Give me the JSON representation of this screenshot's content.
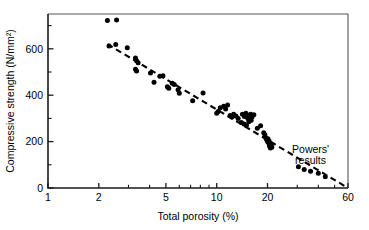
{
  "chart_data": {
    "type": "scatter",
    "title": "",
    "xlabel": "Total porosity (%)",
    "ylabel": "Compressive strength (N/mm²)",
    "xscale": "log",
    "yscale": "linear",
    "xlim": [
      1,
      60
    ],
    "ylim": [
      0,
      750
    ],
    "grid": false,
    "legend": "none",
    "xticks_major": [
      1,
      2,
      5,
      10,
      20,
      60
    ],
    "xtick_labels": [
      "1",
      "2",
      "5",
      "10",
      "20",
      "60"
    ],
    "xticks_minor": [
      3,
      4,
      6,
      7,
      8,
      9,
      30,
      40,
      50
    ],
    "yticks_major": [
      0,
      200,
      400,
      600
    ],
    "ytick_labels": [
      "0",
      "200",
      "400",
      "600"
    ],
    "yticks_minor": [
      100,
      300,
      500,
      700
    ],
    "marker": "filled-circle",
    "marker_color": "#000000",
    "points": [
      [
        2.25,
        722
      ],
      [
        2.55,
        724
      ],
      [
        2.3,
        612
      ],
      [
        2.52,
        618
      ],
      [
        2.95,
        604
      ],
      [
        3.3,
        560
      ],
      [
        3.35,
        548
      ],
      [
        3.42,
        540
      ],
      [
        3.3,
        512
      ],
      [
        3.35,
        504
      ],
      [
        4.05,
        496
      ],
      [
        4.25,
        456
      ],
      [
        4.6,
        482
      ],
      [
        4.8,
        484
      ],
      [
        5.1,
        436
      ],
      [
        5.2,
        430
      ],
      [
        5.45,
        452
      ],
      [
        5.6,
        446
      ],
      [
        5.9,
        424
      ],
      [
        6.0,
        408
      ],
      [
        7.2,
        376
      ],
      [
        8.3,
        410
      ],
      [
        10.0,
        322
      ],
      [
        10.2,
        330
      ],
      [
        10.5,
        346
      ],
      [
        11.0,
        352
      ],
      [
        11.3,
        340
      ],
      [
        11.6,
        358
      ],
      [
        12.0,
        312
      ],
      [
        12.3,
        306
      ],
      [
        12.6,
        318
      ],
      [
        13.0,
        310
      ],
      [
        13.4,
        300
      ],
      [
        14.2,
        318
      ],
      [
        14.6,
        308
      ],
      [
        14.9,
        322
      ],
      [
        15.3,
        300
      ],
      [
        15.6,
        312
      ],
      [
        15.9,
        318
      ],
      [
        16.2,
        306
      ],
      [
        16.6,
        316
      ],
      [
        14.0,
        282
      ],
      [
        14.5,
        276
      ],
      [
        15.0,
        270
      ],
      [
        15.5,
        286
      ],
      [
        16.0,
        292
      ],
      [
        17.4,
        258
      ],
      [
        18.2,
        268
      ],
      [
        19.0,
        238
      ],
      [
        19.3,
        230
      ],
      [
        19.6,
        214
      ],
      [
        19.8,
        208
      ],
      [
        20.0,
        200
      ],
      [
        20.1,
        212
      ],
      [
        20.3,
        196
      ],
      [
        20.4,
        204
      ],
      [
        20.5,
        188
      ],
      [
        20.6,
        180
      ],
      [
        20.7,
        194
      ],
      [
        20.8,
        172
      ],
      [
        21.0,
        184
      ],
      [
        21.2,
        176
      ],
      [
        30.5,
        92
      ],
      [
        33.0,
        80
      ],
      [
        36.0,
        72
      ],
      [
        40.0,
        64
      ],
      [
        44.0,
        48
      ]
    ],
    "trend_line": {
      "style": "dashed",
      "color": "#000000",
      "start": [
        2.25,
        620
      ],
      "end": [
        60,
        0
      ]
    },
    "annotations": [
      {
        "text_lines": [
          "Powers'",
          "results"
        ],
        "x": 36,
        "y": 150
      }
    ]
  },
  "figure": {
    "background_color": "#ffffff",
    "axis_color": "#1a1a1a"
  }
}
